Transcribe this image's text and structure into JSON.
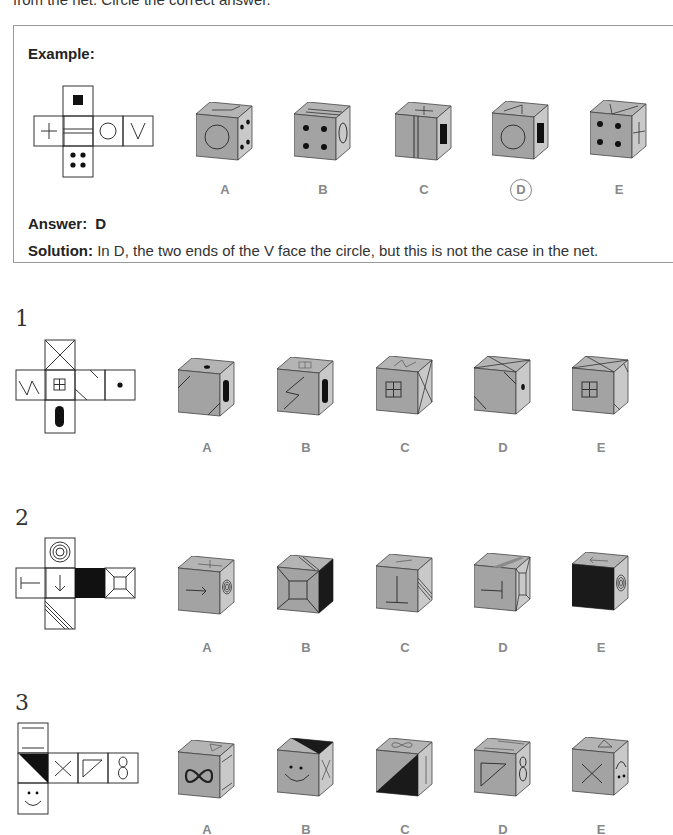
{
  "intro_text": "from the net. Circle the correct answer.",
  "example": {
    "title": "Example:",
    "net_faces": [
      "black-square",
      "plus",
      "double-line",
      "circle",
      "v",
      "four-dots"
    ],
    "options": [
      {
        "label": "A",
        "front": "circle",
        "right": "four-dots",
        "top": "v"
      },
      {
        "label": "B",
        "front": "four-dots",
        "right": "circle",
        "top": "double-line"
      },
      {
        "label": "C",
        "front": "double-line",
        "right": "black-square",
        "top": "plus"
      },
      {
        "label": "D",
        "front": "circle",
        "right": "black-square",
        "top": "v",
        "circled": true
      },
      {
        "label": "E",
        "front": "four-dots",
        "right": "plus",
        "top": "v"
      }
    ],
    "answer_label": "Answer:",
    "answer_value": "D",
    "solution_label": "Solution:",
    "solution_text": "In D, the two ends of the V face the circle, but this is not the case in the net."
  },
  "questions": [
    {
      "number": "1",
      "net_faces": [
        "x-cross",
        "zigzag",
        "window-grid",
        "diagonal-lines",
        "dot",
        "black-oval"
      ],
      "options": [
        {
          "label": "A",
          "front": "diagonal-lines",
          "right": "black-oval",
          "top": "dot"
        },
        {
          "label": "B",
          "front": "zigzag",
          "right": "black-oval",
          "top": "window-grid"
        },
        {
          "label": "C",
          "front": "window-grid",
          "right": "x-cross",
          "top": "zigzag"
        },
        {
          "label": "D",
          "front": "diagonal-lines",
          "right": "dot",
          "top": "x-cross"
        },
        {
          "label": "E",
          "front": "window-grid",
          "right": "diagonal-lines",
          "top": "x-cross"
        }
      ]
    },
    {
      "number": "2",
      "net_faces": [
        "concentric-circles",
        "t-bar",
        "arrow-down",
        "black-fill",
        "frame-square",
        "triple-diagonal"
      ],
      "options": [
        {
          "label": "A",
          "front": "arrow-right",
          "right": "concentric-circles",
          "top": "t-bar"
        },
        {
          "label": "B",
          "front": "frame-square",
          "right": "black-fill",
          "top": "triple-diagonal"
        },
        {
          "label": "C",
          "front": "t-bar-up",
          "right": "triple-diagonal",
          "top": "arrow"
        },
        {
          "label": "D",
          "front": "t-bar-left",
          "right": "frame-square",
          "top": "triple-diagonal"
        },
        {
          "label": "E",
          "front": "black-fill",
          "right": "concentric-circles",
          "top": "arrow-left"
        }
      ]
    },
    {
      "number": "3",
      "net_faces": [
        "two-lines",
        "black-triangle",
        "x",
        "triangle",
        "eight",
        "smiley"
      ],
      "options": [
        {
          "label": "A",
          "front": "infinity",
          "right": "two-lines",
          "top": "triangle"
        },
        {
          "label": "B",
          "front": "smiley",
          "right": "x",
          "top": "black-triangle"
        },
        {
          "label": "C",
          "front": "black-triangle",
          "right": "two-lines",
          "top": "infinity"
        },
        {
          "label": "D",
          "front": "triangle",
          "right": "eight",
          "top": "two-lines"
        },
        {
          "label": "E",
          "front": "x",
          "right": "smiley-rotated",
          "top": "triangle"
        }
      ]
    }
  ],
  "colors": {
    "cube_front": "#a3a3a3",
    "cube_right": "#c9c9c9",
    "cube_top": "#b4b4b4",
    "line": "#333333",
    "label": "#888888",
    "box_border": "#9a9a9a"
  }
}
